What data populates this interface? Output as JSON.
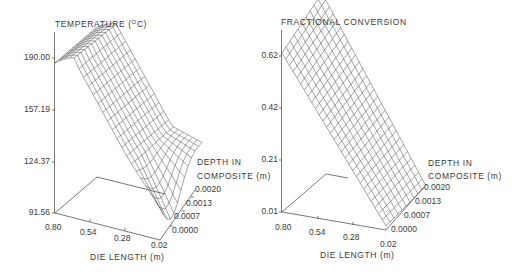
{
  "chart_data": [
    {
      "type": "surface",
      "title": "TEMPERATURE (°C)",
      "zlabel": "TEMPERATURE (°C)",
      "xlabel": "DIE LENGTH (m)",
      "ylabel": "DEPTH IN COMPOSITE (m)",
      "z_ticks": [
        "190.00",
        "157.19",
        "124.37",
        "91.56"
      ],
      "x_ticks": [
        "0.80",
        "0.54",
        "0.28",
        "0.02"
      ],
      "y_ticks": [
        "0.0000",
        "0.0007",
        "0.0013",
        "0.0020"
      ],
      "zlim": [
        91.56,
        190.0
      ],
      "xlim": [
        0.02,
        0.8
      ],
      "ylim": [
        0.0,
        0.002
      ],
      "description": "Wireframe surface: ~190-195 °C near die exit (0.80 m), decreasing along die length toward entrance (~160 °C at 0.28 m), then sharp drop toward ~92 °C at 0.02 m near depth 0.0000–0.0007 m",
      "samples": {
        "die_length": [
          0.8,
          0.54,
          0.28,
          0.02
        ],
        "temperature_at_surface": [
          192,
          175,
          158,
          95
        ]
      }
    },
    {
      "type": "surface",
      "title": "FRACTIONAL CONVERSION",
      "zlabel": "FRACTIONAL CONVERSION",
      "xlabel": "DIE LENGTH (m)",
      "ylabel": "DEPTH IN COMPOSITE (m)",
      "z_ticks": [
        "0.62",
        "0.42",
        "0.21",
        "0.01"
      ],
      "x_ticks": [
        "0.80",
        "0.54",
        "0.28",
        "0.02"
      ],
      "y_ticks": [
        "0.0000",
        "0.0007",
        "0.0013",
        "0.0020"
      ],
      "zlim": [
        0.01,
        0.62
      ],
      "xlim": [
        0.02,
        0.8
      ],
      "ylim": [
        0.0,
        0.002
      ],
      "description": "Wireframe surface: conversion rises from ~0.01 at die entrance (0.02 m) to ~0.62–0.70 at die exit (0.80 m), slightly higher at greater depth",
      "samples": {
        "die_length": [
          0.8,
          0.54,
          0.28,
          0.02
        ],
        "conversion": [
          0.62,
          0.42,
          0.21,
          0.01
        ]
      }
    }
  ],
  "left": {
    "title_main": "TEMPERATURE (",
    "title_sup": "O",
    "title_end": "C)",
    "z_ticks": [
      "190.00",
      "157.19",
      "124.37",
      "91.56"
    ],
    "x_ticks": [
      "0.80",
      "0.54",
      "0.28",
      "0.02"
    ],
    "y_ticks": [
      "0.0000",
      "0.0007",
      "0.0013",
      "0.0020"
    ],
    "xlabel": "DIE LENGTH (m)",
    "ylabel_line1": "DEPTH IN",
    "ylabel_line2": "COMPOSITE (m)"
  },
  "right": {
    "title": "FRACTIONAL CONVERSION",
    "z_ticks": [
      "0.62",
      "0.42",
      "0.21",
      "0.01"
    ],
    "x_ticks": [
      "0.80",
      "0.54",
      "0.28",
      "0.02"
    ],
    "y_ticks": [
      "0.0000",
      "0.0007",
      "0.0013",
      "0.0020"
    ],
    "xlabel": "DIE LENGTH (m)",
    "ylabel_line1": "DEPTH IN",
    "ylabel_line2": "COMPOSITE (m)"
  }
}
